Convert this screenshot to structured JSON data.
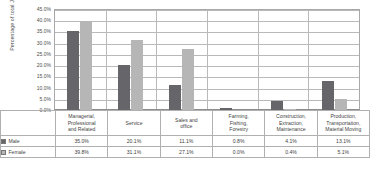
{
  "chart_data": {
    "type": "bar",
    "title": "",
    "xlabel": "",
    "ylabel": "Percentage of total Jobs",
    "ylim": [
      0,
      45
    ],
    "grid": true,
    "legend_position": "bottom-table",
    "categories": [
      "Managerial, Professional and Related",
      "Service",
      "Sales and office",
      "Farming, Fishing, Forestry",
      "Construction, Extraction, Maintenance",
      "Production, Transportation, Material Moving"
    ],
    "category_lines": [
      [
        "Managerial,",
        "Professional",
        "and Related"
      ],
      [
        "Service"
      ],
      [
        "Sales and",
        "office"
      ],
      [
        "Farming,",
        "Fishing,",
        "Forestry"
      ],
      [
        "Construction,",
        "Extraction,",
        "Maintenance"
      ],
      [
        "Production,",
        "Transportation,",
        "Material Moving"
      ]
    ],
    "series": [
      {
        "name": "Male",
        "color": "#66666a",
        "values": [
          35.0,
          20.1,
          11.1,
          0.8,
          4.1,
          13.1
        ],
        "labels": [
          "35.0%",
          "20.1%",
          "11.1%",
          "0.8%",
          "4.1%",
          "13.1%"
        ]
      },
      {
        "name": "Female",
        "color": "#b6b6b6",
        "values": [
          39.8,
          31.1,
          27.1,
          0.0,
          0.4,
          5.1
        ],
        "labels": [
          "39.8%",
          "31.1%",
          "27.1%",
          "0.0%",
          "0.4%",
          "5.1%"
        ]
      }
    ],
    "y_ticks": [
      {
        "value": 45,
        "label": "45.0%"
      },
      {
        "value": 40,
        "label": "40.0%"
      },
      {
        "value": 35,
        "label": "35.0%"
      },
      {
        "value": 30,
        "label": "30.0%"
      },
      {
        "value": 25,
        "label": "25.0%"
      },
      {
        "value": 20,
        "label": "20.0%"
      },
      {
        "value": 15,
        "label": "15.0%"
      },
      {
        "value": 10,
        "label": "10.0%"
      },
      {
        "value": 5,
        "label": "5.0%"
      },
      {
        "value": 0,
        "label": "0.0%"
      }
    ]
  }
}
